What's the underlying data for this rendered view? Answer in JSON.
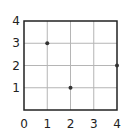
{
  "chart_data": {
    "type": "scatter",
    "title": "",
    "xlabel": "",
    "ylabel": "",
    "xlim": [
      0,
      4
    ],
    "ylim": [
      0,
      4
    ],
    "grid": true,
    "x_ticks": [
      "0",
      "1",
      "2",
      "3",
      "4"
    ],
    "y_ticks": [
      "1",
      "2",
      "3",
      "4"
    ],
    "points": [
      {
        "x": 1,
        "y": 3
      },
      {
        "x": 2,
        "y": 1
      },
      {
        "x": 4,
        "y": 2
      }
    ],
    "colors": {
      "grid": "#b5b5b5",
      "frame": "#222222",
      "point": "#333333"
    }
  }
}
